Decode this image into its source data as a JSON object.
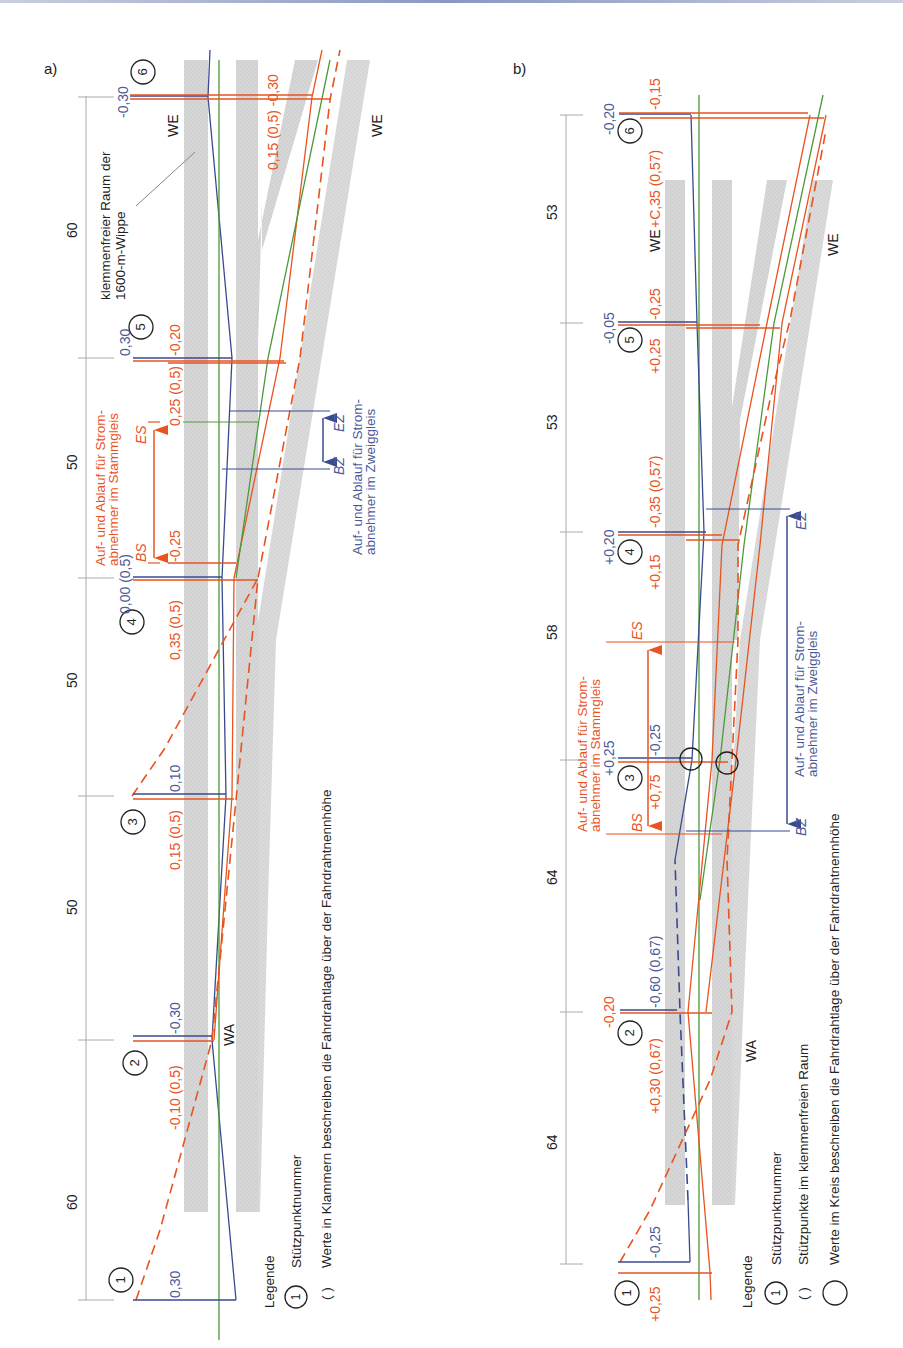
{
  "colors": {
    "orange": "#e8531f",
    "blue": "#3a4a8f",
    "green": "#4a9a3a",
    "track_gray": "#d4d4d4",
    "dim_gray": "#9a9a9a",
    "black": "#222222"
  },
  "panel_a": {
    "label": "a)",
    "spans": [
      "60",
      "50",
      "50",
      "50",
      "60"
    ],
    "support_points": [
      {
        "no": "1",
        "blue": "0,30",
        "orange": ""
      },
      {
        "no": "2",
        "blue": "-0,30",
        "orange": "-0,10 (0,5)"
      },
      {
        "no": "3",
        "blue": "0,10",
        "orange": "0,15 (0,5)"
      },
      {
        "no": "4",
        "blue": "0,00 (0,5)",
        "orange": "0,35 (0,5)",
        "orange_extra": "-0,25"
      },
      {
        "no": "5",
        "blue": "0,30",
        "orange": "0,25 (0,5)",
        "orange_extra": "-0,20"
      },
      {
        "no": "6",
        "blue": "-0,30",
        "orange": "0,15 (0,5) -0,30"
      }
    ],
    "labels": {
      "we_left": "WE",
      "we_right": "WE",
      "wa": "WA",
      "clamp_free": "klemmenfreier Raum der 1600-m-Wippe",
      "clamp_free_line1": "klemmenfreier Raum der",
      "clamp_free_line2": "1600-m-Wippe",
      "main_track_line1": "Auf- und Ablauf für Strom-",
      "main_track_line2": "abnehmer im Stammgleis",
      "branch_track_line1": "Auf- und Ablauf für Strom-",
      "branch_track_line2": "abnehmer im Zweiggleis",
      "bs": "BS",
      "es": "ES",
      "bz": "BZ",
      "ez": "EZ"
    },
    "legend": {
      "title": "Legende",
      "items": [
        {
          "symbol": "1",
          "text": "Stützpunktnummer"
        },
        {
          "symbol": "( )",
          "text": "Werte in Klammern beschreiben die Fahrdrahtlage über der Fahrdrahtnennhöhe"
        }
      ]
    }
  },
  "panel_b": {
    "label": "b)",
    "spans": [
      "64",
      "64",
      "58",
      "53",
      "53"
    ],
    "support_points": [
      {
        "no": "1",
        "blue": "-0,25",
        "orange": "+0,25"
      },
      {
        "no": "2",
        "blue": "-0,60 (0,67)",
        "orange": "+0,30 (0,67)",
        "orange_extra": "-0,20"
      },
      {
        "no": "3",
        "blue": "-0,25",
        "orange": "+0,75",
        "blue_extra": "+0,25"
      },
      {
        "no": "4",
        "blue": "+0,20",
        "orange": "+0,15",
        "orange_extra": "-0,35 (0,57)"
      },
      {
        "no": "5",
        "blue": "-0,05",
        "orange": "+0,25",
        "orange_extra": "-0,25"
      },
      {
        "no": "6",
        "blue": "-0,20",
        "orange": "-0,15"
      }
    ],
    "labels": {
      "we_left": "WE",
      "we_value": "+C,35 (0,57)",
      "we_right": "WE",
      "wa": "WA",
      "main_track_line1": "Auf- und Ablauf für Strom-",
      "main_track_line2": "abnehmer im Stammgleis",
      "branch_track_line1": "Auf- und Ablauf für Strom-",
      "branch_track_line2": "abnehmer im Zweiggleis",
      "bs": "BS",
      "es": "ES",
      "bz": "BZ",
      "ez": "EZ"
    },
    "legend": {
      "title": "Legende",
      "items": [
        {
          "symbol": "1",
          "text": "Stützpunktnummer"
        },
        {
          "symbol": "( )",
          "text": "Stützpunkte im klemmenfreien Raum"
        },
        {
          "symbol": "○",
          "text": "Werte im Kreis beschreiben die Fahrdrahtlage über der Fahrdrahtnennhöhe"
        }
      ]
    }
  }
}
